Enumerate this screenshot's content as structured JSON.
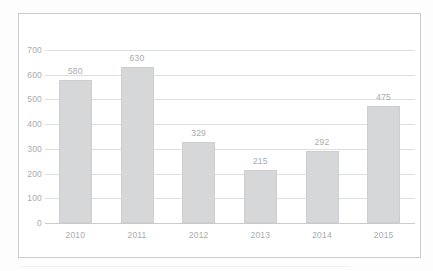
{
  "chart_data": {
    "type": "bar",
    "title": "",
    "subtitle": "",
    "xlabel": "",
    "ylabel": "",
    "categories": [
      "2010",
      "2011",
      "2012",
      "2013",
      "2014",
      "2015"
    ],
    "values": [
      580,
      630,
      329,
      215,
      292,
      475
    ],
    "value_labels": [
      "580",
      "630",
      "329",
      "215",
      "292",
      "475"
    ],
    "ylim": [
      0,
      700
    ],
    "ytick_labels": [
      "0",
      "100",
      "200",
      "300",
      "400",
      "500",
      "600",
      "700"
    ],
    "ytick_values": [
      0,
      100,
      200,
      300,
      400,
      500,
      600,
      700
    ],
    "grid": true,
    "grid_axis": "y",
    "legend": false,
    "legend_position": "none",
    "series": [
      {
        "name": "",
        "values": [
          580,
          630,
          329,
          215,
          292,
          475
        ]
      }
    ],
    "annotations": []
  },
  "style": {
    "bar_fill": "#d6d7d8",
    "bar_border": "#cdced0",
    "gridline_color": "#dedfe0",
    "axis_color": "#c9cbcc",
    "text_color": "#a9abac",
    "frame_color": "#c9cbcc",
    "background": "#ffffff"
  }
}
